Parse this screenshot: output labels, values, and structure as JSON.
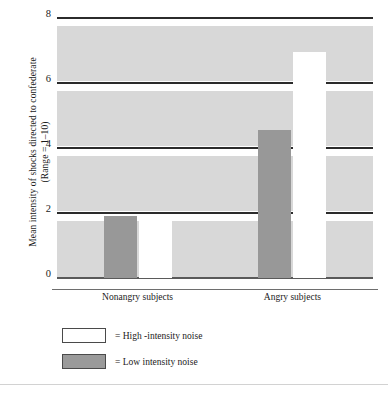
{
  "chart_data": {
    "type": "bar",
    "title": "",
    "xlabel": "",
    "ylabel": "Mean intensity of shocks directed to confederate (Range = 1–10)",
    "ylabel_line1": "Mean intensity of shocks directed to confederate",
    "ylabel_line2": "(Range = 1–10)",
    "categories": [
      "Nonangry subjects",
      "Angry subjects"
    ],
    "series": [
      {
        "name": "High-intensity noise",
        "values": [
          1.85,
          6.95
        ],
        "color": "#ffffff"
      },
      {
        "name": "Low intensity noise",
        "values": [
          1.9,
          4.55
        ],
        "color": "#989898"
      }
    ],
    "ylim": [
      0,
      8
    ],
    "yticks": [
      "0",
      "2",
      "4",
      "6",
      "8"
    ],
    "ytick_values": [
      0,
      2,
      4,
      6,
      8
    ],
    "grid": true,
    "legend_position": "below-left",
    "plot_background": "#d8d8d8",
    "gridline_color": "#2b2b2b"
  },
  "legend": {
    "items": [
      {
        "label": "= High -intensity noise",
        "swatch": "high"
      },
      {
        "label": "= Low intensity noise",
        "swatch": "low"
      }
    ]
  }
}
